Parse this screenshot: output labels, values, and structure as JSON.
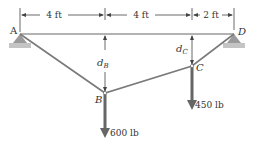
{
  "diagram": {
    "points": {
      "A": {
        "label": "A"
      },
      "B": {
        "label": "B"
      },
      "C": {
        "label": "C"
      },
      "D": {
        "label": "D"
      }
    },
    "dimensions": [
      {
        "label": "4 ft"
      },
      {
        "label": "4 ft"
      },
      {
        "label": "2 ft"
      }
    ],
    "sags": {
      "dB": {
        "main": "d",
        "sub": "B"
      },
      "dC": {
        "main": "d",
        "sub": "C"
      }
    },
    "loads": {
      "B": {
        "label": "600 lb"
      },
      "C": {
        "label": "450 lb"
      }
    },
    "colors": {
      "cable": "#7a7a7a",
      "support": "#9a9a9a",
      "ground": "#c4c4c4",
      "load_arrow": "#666666",
      "text": "#333333"
    }
  }
}
